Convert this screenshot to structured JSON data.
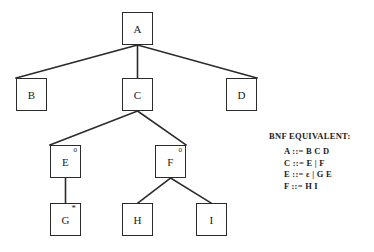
{
  "diagram": {
    "type": "syntax-tree",
    "title": "",
    "nodes": [
      {
        "id": "A",
        "label": "A",
        "superscript": "",
        "x": 122,
        "y": 12,
        "w": 31,
        "h": 33
      },
      {
        "id": "B",
        "label": "B",
        "superscript": "",
        "x": 16,
        "y": 78,
        "w": 31,
        "h": 33
      },
      {
        "id": "C",
        "label": "C",
        "superscript": "",
        "x": 122,
        "y": 78,
        "w": 31,
        "h": 33
      },
      {
        "id": "D",
        "label": "D",
        "superscript": "",
        "x": 226,
        "y": 78,
        "w": 31,
        "h": 33
      },
      {
        "id": "E",
        "label": "E",
        "superscript": "0",
        "x": 50,
        "y": 145,
        "w": 31,
        "h": 33
      },
      {
        "id": "F",
        "label": "F",
        "superscript": "0",
        "x": 155,
        "y": 145,
        "w": 31,
        "h": 33
      },
      {
        "id": "G",
        "label": "G",
        "superscript": "*",
        "x": 50,
        "y": 203,
        "w": 31,
        "h": 33
      },
      {
        "id": "H",
        "label": "H",
        "superscript": "",
        "x": 122,
        "y": 203,
        "w": 31,
        "h": 33
      },
      {
        "id": "I",
        "label": "I",
        "superscript": "",
        "x": 196,
        "y": 203,
        "w": 31,
        "h": 33
      }
    ],
    "edges": [
      {
        "from": "A",
        "to": "B",
        "x1": 137.5,
        "y1": 45,
        "x2": 16,
        "y2": 78
      },
      {
        "from": "A",
        "to": "C",
        "x1": 137.5,
        "y1": 45,
        "x2": 137.5,
        "y2": 78
      },
      {
        "from": "A",
        "to": "D",
        "x1": 137.5,
        "y1": 45,
        "x2": 257,
        "y2": 78
      },
      {
        "from": "C",
        "to": "E",
        "x1": 137.5,
        "y1": 111,
        "x2": 50,
        "y2": 145
      },
      {
        "from": "C",
        "to": "F",
        "x1": 137.5,
        "y1": 111,
        "x2": 186,
        "y2": 145
      },
      {
        "from": "E",
        "to": "G",
        "x1": 65.5,
        "y1": 178,
        "x2": 65.5,
        "y2": 203
      },
      {
        "from": "F",
        "to": "H",
        "x1": 170.5,
        "y1": 178,
        "x2": 138,
        "y2": 203
      },
      {
        "from": "F",
        "to": "I",
        "x1": 170.5,
        "y1": 178,
        "x2": 211,
        "y2": 203
      }
    ],
    "stroke_color": "#2b2b2b",
    "node_fill": "#ffffff"
  },
  "bnf": {
    "title": "BNF EQUIVALENT:",
    "rules": [
      {
        "lhs": "A",
        "op": "::=",
        "rhs": "B C D",
        "text": "A ::= B C D"
      },
      {
        "lhs": "C",
        "op": "::=",
        "rhs": "E | F",
        "text": "C ::= E | F"
      },
      {
        "lhs": "E",
        "op": "::=",
        "rhs": "ε | G E",
        "epsilon": "ε",
        "rhs_after_epsilon": "| G E",
        "text": "E ::= ε | G E"
      },
      {
        "lhs": "F",
        "op": "::=",
        "rhs": "H I",
        "text": "F ::= H I"
      }
    ]
  }
}
